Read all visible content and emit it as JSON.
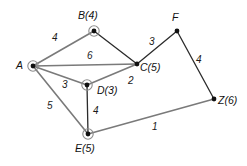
{
  "figure": {
    "type": "weighted-undirected-graph",
    "background_color": "#ffffff",
    "edge_color": "#7a7a7a",
    "node_color": "#111111",
    "ring_color": "#8c8c8c"
  },
  "nodes": [
    {
      "id": "A",
      "label": "A",
      "x": 33,
      "y": 66,
      "ringed": true,
      "label_x": 16,
      "label_y": 60
    },
    {
      "id": "B",
      "label": "B(4)",
      "x": 94,
      "y": 31,
      "ringed": true,
      "label_x": 78,
      "label_y": 10
    },
    {
      "id": "C",
      "label": "C(5)",
      "x": 137,
      "y": 64,
      "ringed": false,
      "label_x": 140,
      "label_y": 62
    },
    {
      "id": "D",
      "label": "D(3)",
      "x": 87,
      "y": 85,
      "ringed": true,
      "label_x": 97,
      "label_y": 85
    },
    {
      "id": "E",
      "label": "E(5)",
      "x": 88,
      "y": 134,
      "ringed": true,
      "label_x": 75,
      "label_y": 143
    },
    {
      "id": "F",
      "label": "F",
      "x": 177,
      "y": 31,
      "ringed": false,
      "label_x": 172,
      "label_y": 12
    },
    {
      "id": "Z",
      "label": "Z(6)",
      "x": 214,
      "y": 99,
      "ringed": false,
      "label_x": 218,
      "label_y": 95
    }
  ],
  "edges": [
    {
      "from": "A",
      "to": "B",
      "weight": "4",
      "style": "thick",
      "label_x": 52,
      "label_y": 33
    },
    {
      "from": "B",
      "to": "C",
      "weight": "",
      "style": "thin",
      "label_x": 0,
      "label_y": 0
    },
    {
      "from": "A",
      "to": "C",
      "weight": "6",
      "style": "thick",
      "label_x": 87,
      "label_y": 51
    },
    {
      "from": "A",
      "to": "D",
      "weight": "3",
      "style": "thick",
      "label_x": 62,
      "label_y": 80
    },
    {
      "from": "A",
      "to": "E",
      "weight": "5",
      "style": "thick",
      "label_x": 47,
      "label_y": 101
    },
    {
      "from": "D",
      "to": "C",
      "weight": "2",
      "style": "thick",
      "label_x": 128,
      "label_y": 76
    },
    {
      "from": "D",
      "to": "E",
      "weight": "4",
      "style": "thin",
      "label_x": 93,
      "label_y": 106
    },
    {
      "from": "C",
      "to": "F",
      "weight": "3",
      "style": "thin",
      "label_x": 149,
      "label_y": 37
    },
    {
      "from": "F",
      "to": "Z",
      "weight": "4",
      "style": "thin",
      "label_x": 196,
      "label_y": 55
    },
    {
      "from": "E",
      "to": "Z",
      "weight": "1",
      "style": "thick",
      "label_x": 152,
      "label_y": 122
    }
  ]
}
